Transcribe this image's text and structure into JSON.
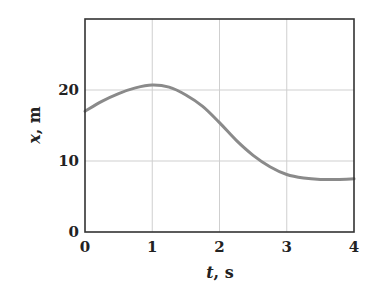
{
  "chart_data": {
    "type": "line",
    "title": "",
    "xlabel": "t, s",
    "xlabel_var": "t",
    "xlabel_unit": ", s",
    "ylabel": "x, m",
    "ylabel_var": "x",
    "ylabel_unit": ", m",
    "xlim": [
      0,
      4
    ],
    "ylim": [
      0,
      30
    ],
    "xticks": [
      0,
      1,
      2,
      3,
      4
    ],
    "yticks": [
      0,
      10,
      20
    ],
    "grid": true,
    "legend": null,
    "series": [
      {
        "name": "x(t)",
        "color": "#8a8a8a",
        "x": [
          0,
          0.25,
          0.5,
          0.75,
          1.0,
          1.25,
          1.5,
          1.75,
          2.0,
          2.25,
          2.5,
          2.75,
          3.0,
          3.25,
          3.5,
          3.75,
          4.0
        ],
        "y": [
          17.0,
          18.4,
          19.5,
          20.3,
          20.7,
          20.4,
          19.3,
          17.7,
          15.4,
          12.9,
          10.8,
          9.2,
          8.1,
          7.6,
          7.4,
          7.4,
          7.5
        ]
      }
    ]
  },
  "colors": {
    "frame": "#333333",
    "grid": "#cfcfcf",
    "curve": "#8a8a8a",
    "text": "#222222"
  }
}
